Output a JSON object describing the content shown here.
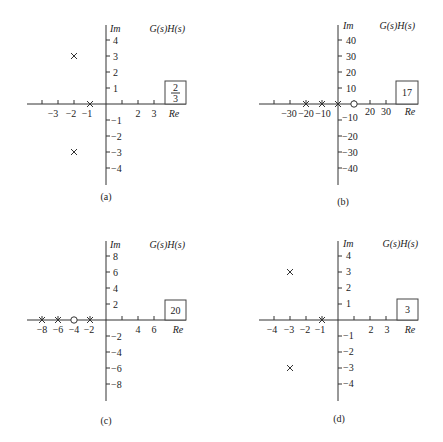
{
  "figure": {
    "panels": [
      {
        "id": "a",
        "caption": "(a)",
        "title": "G(s)H(s)",
        "axis_labels": {
          "re": "Re",
          "im": "Im"
        },
        "gain_box": {
          "type": "fraction",
          "numerator": "2",
          "denominator": "3"
        },
        "x_ticks": [
          "-4",
          "-3",
          "-2",
          "-1",
          "1",
          "2",
          "3"
        ],
        "x_tick_labels": [
          "−3",
          "−2",
          "−1",
          "2",
          "3"
        ],
        "y_tick_labels_pos": [
          "4",
          "3",
          "2",
          "1"
        ],
        "y_tick_labels_neg": [
          "−1",
          "−2",
          "−3",
          "−4"
        ],
        "poles": [
          [
            -1,
            0
          ],
          [
            -2,
            3
          ],
          [
            -2,
            -3
          ]
        ],
        "zeros": []
      },
      {
        "id": "b",
        "caption": "(b)",
        "title": "G(s)H(s)",
        "axis_labels": {
          "re": "Re",
          "im": "Im"
        },
        "gain_box": {
          "type": "value",
          "value": "17"
        },
        "x_tick_labels": [
          "−30",
          "−20",
          "−10",
          "20",
          "30"
        ],
        "y_tick_labels_pos": [
          "40",
          "30",
          "20",
          "10"
        ],
        "y_tick_labels_neg": [
          "−10",
          "−20",
          "−30",
          "−40"
        ],
        "poles": [
          [
            0,
            0
          ],
          [
            -10,
            0
          ],
          [
            -20,
            0
          ]
        ],
        "zeros": [
          [
            10,
            0
          ]
        ]
      },
      {
        "id": "c",
        "caption": "(c)",
        "title": "G(s)H(s)",
        "axis_labels": {
          "re": "Re",
          "im": "Im"
        },
        "gain_box": {
          "type": "value",
          "value": "20"
        },
        "x_tick_labels": [
          "−8",
          "−6",
          "−4",
          "−2",
          "4",
          "6"
        ],
        "y_tick_labels_pos": [
          "8",
          "6",
          "4",
          "2"
        ],
        "y_tick_labels_neg": [
          "−2",
          "−4",
          "−6",
          "−8"
        ],
        "poles": [
          [
            -2,
            0
          ],
          [
            -6,
            0
          ],
          [
            -8,
            0
          ]
        ],
        "zeros": [
          [
            -4,
            0
          ]
        ]
      },
      {
        "id": "d",
        "caption": "(d)",
        "title": "G(s)H(s)",
        "axis_labels": {
          "re": "Re",
          "im": "Im"
        },
        "gain_box": {
          "type": "value",
          "value": "3"
        },
        "x_tick_labels": [
          "−4",
          "−3",
          "−2",
          "−1",
          "2",
          "3"
        ],
        "y_tick_labels_pos": [
          "4",
          "3",
          "2",
          "1"
        ],
        "y_tick_labels_neg": [
          "−1",
          "−2",
          "−3",
          "−4"
        ],
        "poles": [
          [
            -1,
            0
          ],
          [
            -3,
            3
          ],
          [
            -3,
            -3
          ]
        ],
        "zeros": []
      }
    ]
  }
}
